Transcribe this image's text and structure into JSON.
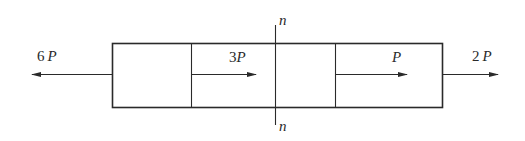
{
  "diagram": {
    "type": "axial-load bar free-body diagram",
    "colors": {
      "stroke": "#2a2a2a",
      "background": "#ffffff"
    },
    "section": {
      "label_top": "n",
      "label_bottom": "n"
    },
    "forces": [
      {
        "id": "f1",
        "coef": "6",
        "var": "P",
        "direction": "left",
        "position": "left end"
      },
      {
        "id": "f2",
        "coef": "3",
        "var": "P",
        "direction": "right",
        "position": "at first divider"
      },
      {
        "id": "f3",
        "coef": "",
        "var": "P",
        "direction": "right",
        "position": "at second divider"
      },
      {
        "id": "f4",
        "coef": "2",
        "var": "P",
        "direction": "right",
        "position": "right end"
      }
    ]
  }
}
